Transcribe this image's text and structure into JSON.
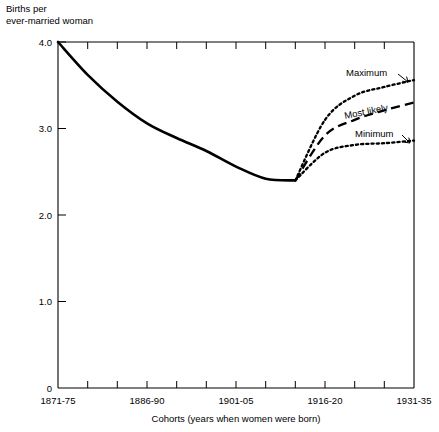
{
  "chart_data": {
    "type": "line",
    "title": "",
    "ylabel_line1": "Births per",
    "ylabel_line2": "ever-married woman",
    "xlabel": "Cohorts (years when women were born)",
    "ylim": [
      0,
      4.0
    ],
    "yticks": [
      "0",
      "1.0",
      "2.0",
      "3.0",
      "4.0"
    ],
    "ytick_values": [
      0,
      1.0,
      2.0,
      3.0,
      4.0
    ],
    "grid": false,
    "legend_position": "inline-annotations",
    "x_categories": [
      "1871-75",
      "1876-80",
      "1881-85",
      "1886-90",
      "1891-95",
      "1896-00",
      "1901-05",
      "1906-10",
      "1911-15",
      "1916-20",
      "1921-25",
      "1926-30",
      "1931-35"
    ],
    "xtick_labels_shown": [
      "1871-75",
      "1886-90",
      "1901-05",
      "1916-20",
      "1931-35"
    ],
    "xtick_label_indices": [
      0,
      3,
      6,
      9,
      12
    ],
    "series": [
      {
        "name": "Observed",
        "style": "solid",
        "x_indices": [
          0,
          1,
          2,
          3,
          4,
          5,
          6,
          7,
          8
        ],
        "values": [
          4.0,
          3.62,
          3.31,
          3.06,
          2.89,
          2.74,
          2.56,
          2.42,
          2.4
        ]
      },
      {
        "name": "Maximum",
        "style": "dotted",
        "x_indices": [
          8,
          9,
          10,
          11,
          12
        ],
        "values": [
          2.4,
          3.1,
          3.38,
          3.48,
          3.56
        ]
      },
      {
        "name": "Most likely",
        "style": "dashed",
        "x_indices": [
          8,
          9,
          10,
          11,
          12
        ],
        "values": [
          2.4,
          2.92,
          3.1,
          3.21,
          3.3
        ]
      },
      {
        "name": "Minimum",
        "style": "dotted",
        "x_indices": [
          8,
          9,
          10,
          11,
          12
        ],
        "values": [
          2.4,
          2.72,
          2.81,
          2.83,
          2.86
        ]
      }
    ],
    "annotations": [
      {
        "text": "Maximum",
        "target_series": "Maximum",
        "leader": true
      },
      {
        "text": "Most likely",
        "target_series": "Most likely",
        "leader": false
      },
      {
        "text": "Minimum",
        "target_series": "Minimum",
        "leader": true
      }
    ],
    "colors": {
      "line": "#000000",
      "axis": "#000000",
      "background": "#ffffff"
    }
  }
}
